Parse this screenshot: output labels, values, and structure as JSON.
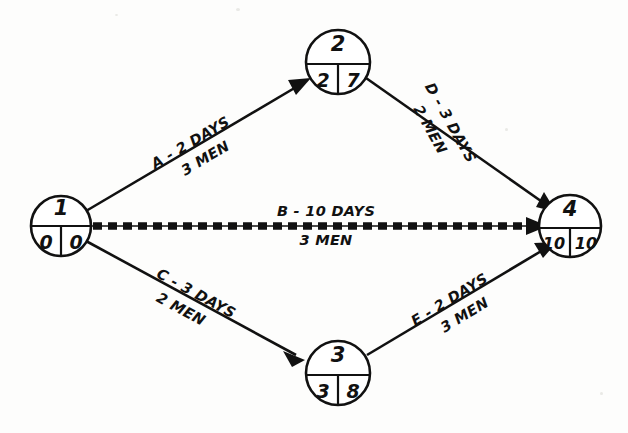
{
  "diagram": {
    "type": "pert-cpm-network-diagram",
    "background_color": "#fdfdfc",
    "ink_color": "#111111",
    "nodes": [
      {
        "id": "node-1",
        "event_number": "1",
        "earliest_time": "0",
        "latest_time": "0",
        "cx": 61,
        "cy": 226,
        "r": 30
      },
      {
        "id": "node-2",
        "event_number": "2",
        "earliest_time": "2",
        "latest_time": "7",
        "cx": 338,
        "cy": 62,
        "r": 32
      },
      {
        "id": "node-3",
        "event_number": "3",
        "earliest_time": "3",
        "latest_time": "8",
        "cx": 338,
        "cy": 373,
        "r": 32
      },
      {
        "id": "node-4",
        "event_number": "4",
        "earliest_time": "10",
        "latest_time": "10",
        "cx": 570,
        "cy": 226,
        "r": 31
      }
    ],
    "edges": [
      {
        "id": "edge-a",
        "activity": "A",
        "from": "node-1",
        "to": "node-2",
        "duration_line": "A - 2 DAYS",
        "resource_line": "3 MEN",
        "duration_days": 2,
        "men": 3,
        "critical": false,
        "label_angle": -30.6,
        "label_x": 196,
        "label_y": 152
      },
      {
        "id": "edge-d",
        "activity": "D",
        "from": "node-2",
        "to": "node-4",
        "duration_line": "D - 3 DAYS",
        "resource_line": "2 MEN",
        "duration_days": 3,
        "men": 2,
        "critical": false,
        "label_angle": 60.8,
        "label_x": 441,
        "label_y": 128
      },
      {
        "id": "edge-b",
        "activity": "B",
        "from": "node-1",
        "to": "node-4",
        "duration_line": "B - 10 DAYS",
        "resource_line": "3 MEN",
        "duration_days": 10,
        "men": 3,
        "critical": true,
        "label_angle": 0,
        "label_x": 326,
        "label_y": 226
      },
      {
        "id": "edge-c",
        "activity": "C",
        "from": "node-1",
        "to": "node-3",
        "duration_line": "C - 3 DAYS",
        "resource_line": "2 MEN",
        "duration_days": 3,
        "men": 2,
        "critical": false,
        "label_angle": 28.5,
        "label_x": 191,
        "label_y": 303
      },
      {
        "id": "edge-e",
        "activity": "E",
        "from": "node-3",
        "to": "node-4",
        "duration_line": "E - 2 DAYS",
        "resource_line": "3 MEN",
        "duration_days": 2,
        "men": 3,
        "critical": false,
        "label_angle": -31.5,
        "label_x": 455,
        "label_y": 309
      }
    ]
  }
}
